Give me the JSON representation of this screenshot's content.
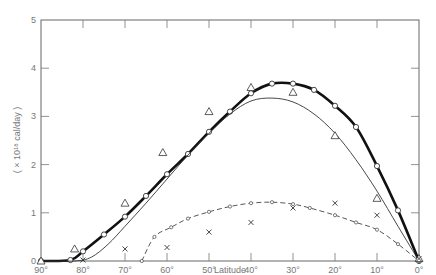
{
  "chart_data": {
    "type": "line",
    "title": "",
    "xlabel": "Latitude",
    "ylabel": "( × 10¹⁸ cal/day )",
    "xlim": [
      90,
      0
    ],
    "ylim": [
      0,
      5
    ],
    "x_ticks": [
      "90°",
      "80°",
      "70°",
      "60°",
      "50°",
      "40°",
      "30°",
      "20°",
      "10°",
      "0°"
    ],
    "y_ticks": [
      "0",
      "1",
      "2",
      "3",
      "4",
      "5"
    ],
    "grid": false,
    "legend": null,
    "series": [
      {
        "name": "thick curve (open circles)",
        "style": "thick-solid",
        "x": [
          90,
          83,
          80,
          75,
          70,
          65,
          60,
          55,
          50,
          45,
          40,
          35,
          30,
          25,
          20,
          15,
          10,
          5,
          0
        ],
        "y": [
          0,
          0.02,
          0.2,
          0.55,
          0.92,
          1.35,
          1.8,
          2.22,
          2.68,
          3.1,
          3.48,
          3.68,
          3.68,
          3.55,
          3.22,
          2.78,
          1.97,
          1.05,
          0
        ]
      },
      {
        "name": "thin curve",
        "style": "thin-solid",
        "x": [
          90,
          82,
          78,
          74,
          70,
          65,
          60,
          55,
          50,
          45,
          40,
          35,
          30,
          25,
          20,
          15,
          10,
          5,
          0
        ],
        "y": [
          0,
          0,
          0.08,
          0.35,
          0.72,
          1.2,
          1.7,
          2.2,
          2.65,
          3.05,
          3.32,
          3.38,
          3.3,
          3.05,
          2.65,
          2.1,
          1.45,
          0.72,
          0
        ]
      },
      {
        "name": "dashed curve (small circles)",
        "style": "dashed",
        "x": [
          66,
          63,
          59,
          55,
          50,
          45,
          40,
          35,
          30,
          26,
          20,
          15,
          10,
          5,
          0
        ],
        "y": [
          0,
          0.5,
          0.7,
          0.88,
          1.02,
          1.13,
          1.2,
          1.22,
          1.18,
          1.1,
          0.95,
          0.8,
          0.65,
          0.35,
          0
        ]
      },
      {
        "name": "triangles",
        "style": "markers-triangle",
        "x": [
          90,
          82,
          70,
          61,
          50,
          40,
          30,
          20,
          10,
          0
        ],
        "y": [
          0,
          0.25,
          1.2,
          2.25,
          3.1,
          3.6,
          3.5,
          2.6,
          1.3,
          0.05
        ]
      },
      {
        "name": "crosses",
        "style": "markers-cross",
        "x": [
          80,
          70,
          60,
          50,
          40,
          30,
          20,
          10,
          0
        ],
        "y": [
          0.02,
          0.25,
          0.28,
          0.6,
          0.8,
          1.1,
          1.2,
          0.95,
          0.05
        ]
      }
    ]
  }
}
